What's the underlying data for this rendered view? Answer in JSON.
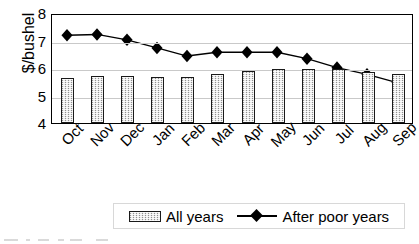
{
  "chart_data": {
    "type": "bar",
    "title": "",
    "xlabel": "",
    "ylabel": "$/bushel",
    "ylim": [
      4,
      8
    ],
    "yticks": [
      8,
      7,
      6,
      5,
      4
    ],
    "grid": true,
    "legend_position": "bottom",
    "categories": [
      "Oct",
      "Nov",
      "Dec",
      "Jan",
      "Feb",
      "Mar",
      "Apr",
      "May",
      "Jun",
      "Jul",
      "Aug",
      "Sep"
    ],
    "series": [
      {
        "name": "All years",
        "type": "bar",
        "values": [
          5.65,
          5.72,
          5.72,
          5.67,
          5.67,
          5.78,
          5.88,
          5.95,
          5.95,
          5.98,
          5.85,
          5.8
        ]
      },
      {
        "name": "After poor years",
        "type": "line",
        "marker": "diamond",
        "values": [
          7.25,
          7.28,
          7.08,
          6.78,
          6.48,
          6.62,
          6.62,
          6.62,
          6.38,
          6.05,
          5.8,
          5.5
        ]
      }
    ]
  },
  "axis": {
    "y_title": "$/bushel",
    "y_tick_labels": [
      "8",
      "7",
      "6",
      "5",
      "4"
    ],
    "x_tick_labels": [
      "Oct",
      "Nov",
      "Dec",
      "Jan",
      "Feb",
      "Mar",
      "Apr",
      "May",
      "Jun",
      "Jul",
      "Aug",
      "Sep"
    ]
  },
  "legend": {
    "bar_label": "All years",
    "line_label": "After poor years"
  },
  "colors": {
    "bar_fill": "#d4d4d4",
    "bar_border": "#1a1a1a",
    "line": "#000000",
    "marker": "#000000",
    "gridline": "#c9c9c9",
    "frame": "#000000"
  }
}
